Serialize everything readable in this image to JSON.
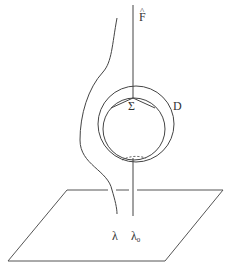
{
  "diagram": {
    "labels": {
      "f_hat": "F",
      "f_hat_accent": "^",
      "sigma": "Σ",
      "disk": "D",
      "lambda": "λ",
      "lambda0": "λ",
      "lambda0_sub": "0"
    },
    "elements": {
      "plane": {
        "corners": [
          [
            67,
            190
          ],
          [
            223,
            190
          ],
          [
            165,
            261
          ],
          [
            8,
            261
          ]
        ]
      },
      "vertical_line_lambda0": {
        "x": 133,
        "y_top": 5,
        "y_bottom": 216
      },
      "outer_circle_D": {
        "cx": 136,
        "cy": 124,
        "r": 38
      },
      "inner_circle_Sigma": {
        "cx": 134,
        "cy": 129,
        "r": 31
      },
      "curve_lambda": "left curved strand from top (~(117,15)) bending left around circles down to (~(117,214))"
    },
    "colors": {
      "stroke": "#444444",
      "background": "#ffffff"
    }
  }
}
